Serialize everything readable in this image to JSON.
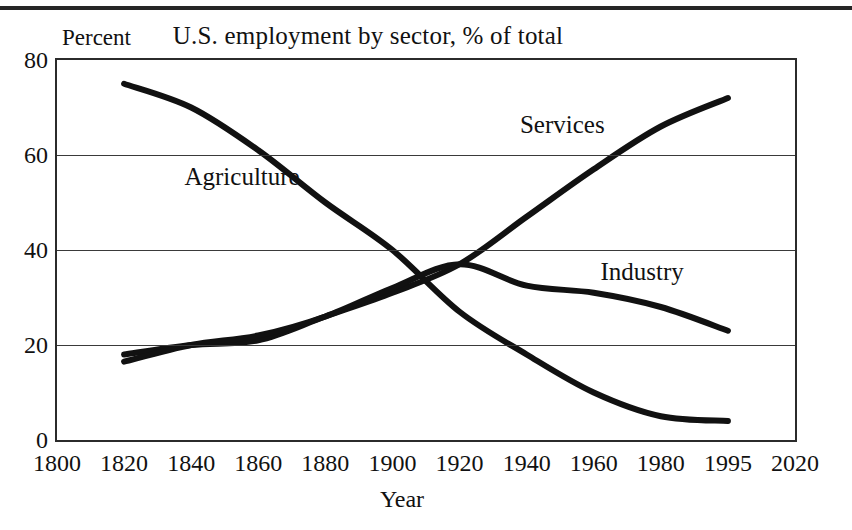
{
  "figure": {
    "title": "U.S. employment by sector, % of total",
    "y_axis_title": "Percent",
    "x_axis_title": "Year",
    "line_color": "#111111",
    "grid_color": "#3a3a3a",
    "frame_color": "#2b2b2b"
  },
  "chart_data": {
    "type": "line",
    "title": "U.S. employment by sector, % of total",
    "xlabel": "Year",
    "ylabel": "Percent",
    "xlim": [
      1800,
      2020
    ],
    "ylim": [
      0,
      80
    ],
    "grid": "horizontal",
    "legend": "inline-labels",
    "xticks": [
      "1800",
      "1820",
      "1840",
      "1860",
      "1880",
      "1900",
      "1920",
      "1940",
      "1960",
      "1980",
      "1995",
      "2020"
    ],
    "xtick_values": [
      1800,
      1820,
      1840,
      1860,
      1880,
      1900,
      1920,
      1940,
      1960,
      1980,
      1995,
      2020
    ],
    "yticks": [
      "0",
      "20",
      "40",
      "60",
      "80"
    ],
    "ytick_values": [
      0,
      20,
      40,
      60,
      80
    ],
    "series": [
      {
        "name": "Agriculture",
        "label_x": 1838,
        "label_y": 55,
        "x": [
          1820,
          1840,
          1860,
          1880,
          1900,
          1920,
          1940,
          1960,
          1980,
          1995
        ],
        "values": [
          75,
          70,
          61,
          50,
          40,
          27,
          18,
          10,
          5,
          4
        ]
      },
      {
        "name": "Services",
        "label_x": 1938,
        "label_y": 66,
        "x": [
          1820,
          1840,
          1860,
          1880,
          1900,
          1920,
          1940,
          1960,
          1980,
          1995
        ],
        "values": [
          18,
          20,
          21,
          26,
          31,
          37,
          47,
          57,
          66,
          72
        ]
      },
      {
        "name": "Industry",
        "label_x": 1962,
        "label_y": 35,
        "x": [
          1820,
          1840,
          1860,
          1880,
          1900,
          1920,
          1940,
          1960,
          1980,
          1995
        ],
        "values": [
          16.5,
          20,
          22,
          26,
          32,
          37,
          32.5,
          31,
          28,
          23
        ]
      }
    ]
  }
}
